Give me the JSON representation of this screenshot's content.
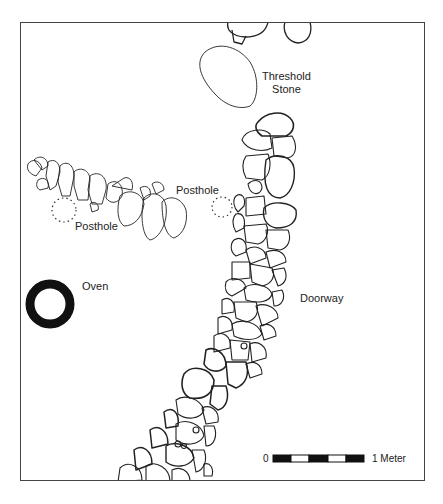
{
  "figure": {
    "type": "archaeological-plan",
    "labels": {
      "threshold_line1": "Threshold",
      "threshold_line2": "Stone",
      "posthole_left": "Posthole",
      "posthole_right": "Posthole",
      "oven": "Oven",
      "doorway": "Doorway"
    },
    "scale_bar": {
      "start_label": "0",
      "end_label": "1 Meter",
      "segments": 5
    },
    "colors": {
      "frame": "#444444",
      "stone_outline": "#222222",
      "oven_fill": "#111111",
      "background": "#ffffff"
    }
  }
}
